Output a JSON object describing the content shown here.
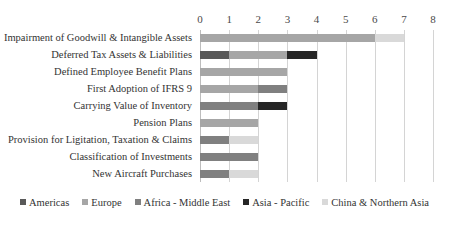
{
  "chart_data": {
    "type": "bar",
    "orientation": "horizontal",
    "stacked": true,
    "title": "",
    "subtitle": "",
    "xlabel": "",
    "ylabel": "",
    "xlim": [
      0,
      8
    ],
    "xticks": [
      0,
      1,
      2,
      3,
      4,
      5,
      6,
      7,
      8
    ],
    "xtick_labels": [
      "0",
      "1",
      "2",
      "3",
      "4",
      "5",
      "6",
      "7",
      "8"
    ],
    "grid": true,
    "grid_axis": "x",
    "legend_position": "bottom",
    "categories": [
      "Impairment of Goodwill & Intangible Assets",
      "Deferred Tax Assets & Liabilities",
      "Defined Employee Benefit Plans",
      "First Adoption of IFRS 9",
      "Carrying Value of Inventory",
      "Pension Plans",
      "Provision for Ligitation, Taxation & Claims",
      "Classification of Investments",
      "New Aircraft Purchases"
    ],
    "series": [
      {
        "name": "Americas",
        "color": "#595959",
        "values": [
          0,
          1,
          0,
          0,
          0,
          0,
          0,
          0,
          0
        ]
      },
      {
        "name": "Europe",
        "color": "#a6a6a6",
        "values": [
          6,
          2,
          3,
          2,
          0,
          2,
          0,
          0,
          0
        ]
      },
      {
        "name": "Africa - Middle East",
        "color": "#808080",
        "values": [
          0,
          0,
          0,
          1,
          2,
          0,
          1,
          2,
          1
        ]
      },
      {
        "name": "Asia - Pacific",
        "color": "#262626",
        "values": [
          0,
          1,
          0,
          0,
          1,
          0,
          0,
          0,
          0
        ]
      },
      {
        "name": "China & Northern Asia",
        "color": "#d9d9d9",
        "values": [
          1,
          0,
          0,
          0,
          0,
          0,
          1,
          0,
          1
        ]
      }
    ],
    "totals": [
      7,
      4,
      3,
      3,
      3,
      2,
      2,
      2,
      2
    ]
  },
  "legend": {
    "entries": [
      {
        "label": "Americas",
        "color": "#595959"
      },
      {
        "label": "Europe",
        "color": "#a6a6a6"
      },
      {
        "label": "Africa - Middle East",
        "color": "#808080"
      },
      {
        "label": "Asia - Pacific",
        "color": "#262626"
      },
      {
        "label": "China & Northern Asia",
        "color": "#d9d9d9"
      }
    ]
  }
}
